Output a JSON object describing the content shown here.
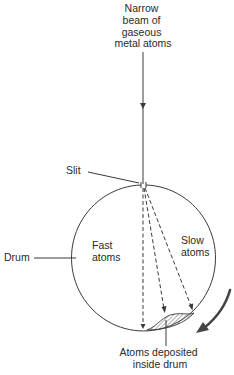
{
  "diagram": {
    "type": "apparatus",
    "beam_label": [
      "Narrow",
      "beam of",
      "gaseous",
      "metal atoms"
    ],
    "slit_label": "Slit",
    "drum_label": "Drum",
    "fast_label": [
      "Fast",
      "atoms"
    ],
    "slow_label": [
      "Slow",
      "atoms"
    ],
    "deposit_label": [
      "Atoms deposited",
      "inside drum"
    ],
    "rotation_arrow": "clockwise-rotation-arrow",
    "colors": {
      "line": "#3a3a3a",
      "text": "#2a2a2a",
      "rotation_arrow": "#444444",
      "background": "#ffffff"
    }
  }
}
